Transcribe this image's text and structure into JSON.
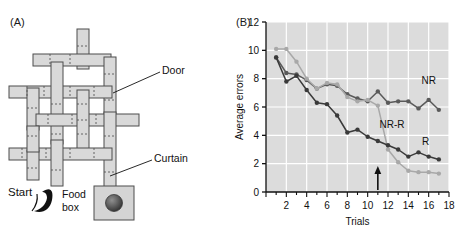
{
  "panels": {
    "a": {
      "label": "(A)"
    },
    "b": {
      "label": "(B)"
    }
  },
  "maze": {
    "annotations": {
      "door": "Door",
      "curtain": "Curtain",
      "start": "Start",
      "food_box_line1": "Food",
      "food_box_line2": "box"
    },
    "colors": {
      "corridor_fill": "#d9d9d9",
      "corridor_stroke": "#4d4d4d",
      "food_box_fill": "#d4d4d4",
      "pellet": "#5a5a5a"
    },
    "corridors": [
      {
        "name": "v-top-center",
        "x": 78,
        "y": 31,
        "w": 11,
        "h": 36,
        "dir": "v"
      },
      {
        "name": "h-upper-left",
        "x": 36,
        "y": 55,
        "w": 54,
        "h": 11,
        "dir": "h"
      },
      {
        "name": "h-upper-right",
        "x": 88,
        "y": 55,
        "w": 22,
        "h": 11,
        "dir": "h"
      },
      {
        "name": "v-right-upper",
        "x": 105,
        "y": 60,
        "w": 11,
        "h": 52,
        "dir": "v"
      },
      {
        "name": "h-mid-left",
        "x": 10,
        "y": 88,
        "w": 42,
        "h": 11,
        "dir": "h"
      },
      {
        "name": "v-left-upper",
        "x": 28,
        "y": 92,
        "w": 11,
        "h": 48,
        "dir": "v"
      },
      {
        "name": "v-center-a",
        "x": 52,
        "y": 64,
        "w": 11,
        "h": 80,
        "dir": "v"
      },
      {
        "name": "h-mid-wide",
        "x": 52,
        "y": 88,
        "w": 54,
        "h": 11,
        "dir": "h"
      },
      {
        "name": "h-mid-3",
        "x": 38,
        "y": 116,
        "w": 92,
        "h": 11,
        "dir": "h"
      },
      {
        "name": "v-center-b",
        "x": 78,
        "y": 95,
        "w": 11,
        "h": 56,
        "dir": "v"
      },
      {
        "name": "v-right-mid",
        "x": 105,
        "y": 112,
        "w": 11,
        "h": 46,
        "dir": "v"
      },
      {
        "name": "h-lower-left",
        "x": 10,
        "y": 150,
        "w": 100,
        "h": 11,
        "dir": "h"
      },
      {
        "name": "v-left-lower",
        "x": 28,
        "y": 155,
        "w": 11,
        "h": 28,
        "dir": "v"
      },
      {
        "name": "v-center-lower",
        "x": 52,
        "y": 140,
        "w": 11,
        "h": 44,
        "dir": "v"
      },
      {
        "name": "v-food-stem",
        "x": 105,
        "y": 155,
        "w": 11,
        "h": 32,
        "dir": "v"
      }
    ]
  },
  "chart_data": {
    "type": "line",
    "title": "",
    "xlabel": "Trials",
    "ylabel": "Average errors",
    "xlim": [
      0,
      18
    ],
    "ylim": [
      0,
      12
    ],
    "xticks": [
      0,
      2,
      4,
      6,
      8,
      10,
      12,
      14,
      16,
      18
    ],
    "xtick_labels": [
      "0",
      "2",
      "4",
      "6",
      "8",
      "10",
      "12",
      "14",
      "16",
      "18"
    ],
    "yticks": [
      0,
      2,
      4,
      6,
      8,
      10,
      12
    ],
    "ytick_labels": [
      "0",
      "2",
      "4",
      "6",
      "8",
      "10",
      "12"
    ],
    "x": [
      1,
      2,
      3,
      4,
      5,
      6,
      7,
      8,
      9,
      10,
      11,
      12,
      13,
      14,
      15,
      16,
      17
    ],
    "grid": true,
    "legend_position": "inline-annotations",
    "plot_background": "#dcdcdc",
    "annotations": [
      {
        "name": "reward-introduced-arrow",
        "x": 11,
        "text": "",
        "type": "arrow-up"
      }
    ],
    "series": [
      {
        "name": "NR",
        "label": "NR",
        "color": "#5a5a5a",
        "label_x": 16.0,
        "label_y": 7.6,
        "values": [
          9.5,
          8.4,
          8.3,
          7.9,
          7.3,
          7.6,
          7.5,
          6.9,
          6.6,
          6.4,
          7.1,
          6.3,
          6.4,
          6.4,
          5.9,
          6.5,
          5.8
        ]
      },
      {
        "name": "NR-R",
        "label": "NR-R",
        "color": "#a8a8a8",
        "label_x": 12.4,
        "label_y": 4.5,
        "values": [
          10.1,
          10.1,
          9.2,
          8.0,
          7.3,
          7.7,
          7.6,
          6.7,
          6.4,
          6.5,
          6.1,
          3.0,
          2.1,
          1.5,
          1.4,
          1.4,
          1.3
        ]
      },
      {
        "name": "R",
        "label": "R",
        "color": "#3a3a3a",
        "label_x": 15.7,
        "label_y": 3.3,
        "values": [
          9.5,
          7.8,
          8.2,
          7.2,
          6.3,
          6.2,
          5.4,
          4.2,
          4.4,
          3.9,
          3.6,
          3.3,
          3.0,
          2.5,
          2.8,
          2.5,
          2.3
        ]
      }
    ]
  }
}
